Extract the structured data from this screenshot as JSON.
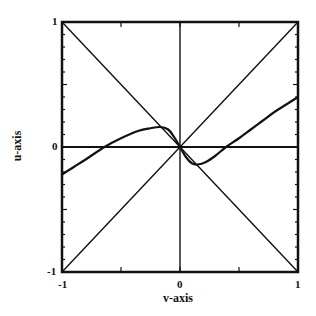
{
  "chart_data": {
    "type": "line",
    "title": "",
    "xlabel": "v-axis",
    "ylabel": "u-axis",
    "xlim": [
      -1,
      1
    ],
    "ylim": [
      -1,
      1
    ],
    "grid": false,
    "legend": null,
    "x_ticks": [
      -1,
      0,
      1
    ],
    "y_ticks": [
      -1,
      0,
      1
    ],
    "x_tick_labels": [
      "-1",
      "0",
      "1"
    ],
    "y_tick_labels": [
      "-1",
      "0",
      "1"
    ],
    "reference_lines": [
      {
        "name": "u=v diagonal",
        "x": [
          -1,
          1
        ],
        "y": [
          -1,
          1
        ]
      },
      {
        "name": "u=-v diagonal",
        "x": [
          -1,
          1
        ],
        "y": [
          1,
          -1
        ]
      },
      {
        "name": "u=0 axis",
        "x": [
          -1,
          1
        ],
        "y": [
          0,
          0
        ]
      },
      {
        "name": "v=0 axis",
        "x": [
          0,
          0
        ],
        "y": [
          -1,
          1
        ]
      }
    ],
    "series": [
      {
        "name": "curve",
        "x": [
          -1.0,
          -0.9,
          -0.8,
          -0.64,
          -0.5,
          -0.35,
          -0.25,
          -0.17,
          -0.1,
          -0.05,
          0.0,
          0.05,
          0.1,
          0.15,
          0.22,
          0.3,
          0.39,
          0.5,
          0.6,
          0.7,
          0.8,
          0.9,
          1.0
        ],
        "y": [
          -0.22,
          -0.16,
          -0.1,
          0.0,
          0.07,
          0.13,
          0.15,
          0.16,
          0.14,
          0.08,
          0.0,
          -0.08,
          -0.13,
          -0.14,
          -0.12,
          -0.07,
          0.0,
          0.07,
          0.14,
          0.21,
          0.28,
          0.34,
          0.4
        ]
      }
    ]
  }
}
